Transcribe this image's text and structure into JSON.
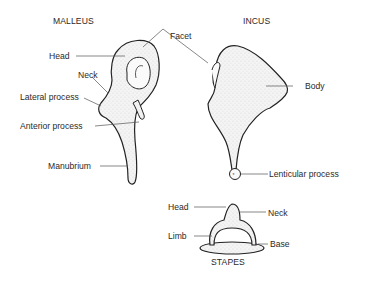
{
  "figure": {
    "malleus": {
      "title": "MALLEUS",
      "labels": {
        "head": "Head",
        "neck": "Neck",
        "lateral_process": "Lateral process",
        "anterior_process": "Anterior process",
        "manubrium": "Manubrium"
      }
    },
    "shared": {
      "facet": "Facet"
    },
    "incus": {
      "title": "INCUS",
      "labels": {
        "body": "Body",
        "lenticular_process": "Lenticular process"
      }
    },
    "stapes": {
      "title": "STAPES",
      "labels": {
        "head": "Head",
        "neck": "Neck",
        "limb": "Limb",
        "base": "Base"
      }
    }
  }
}
